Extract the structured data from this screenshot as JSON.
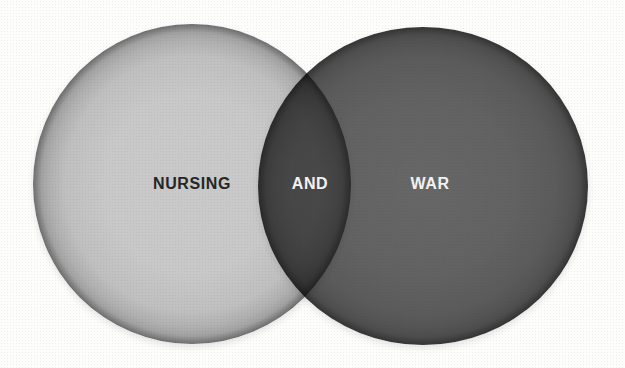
{
  "page": {
    "background_color": "#fdfdfc"
  },
  "venn": {
    "type": "venn-2-set",
    "sets": [
      {
        "id": "nursing",
        "label": "NURSING",
        "fill_color": "#c7c7c7",
        "label_color": "#262626"
      },
      {
        "id": "war",
        "label": "WAR",
        "fill_color": "#5f5f5f",
        "label_color": "#f4f4f4"
      }
    ],
    "intersection": {
      "label": "AND",
      "fill_color": "#494949",
      "label_color": "#f4f4f4"
    }
  }
}
